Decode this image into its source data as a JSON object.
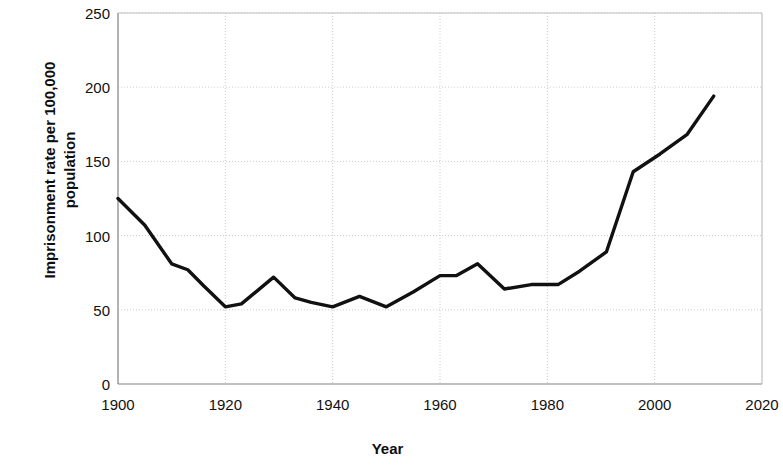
{
  "chart_data": {
    "type": "line",
    "title": "",
    "xlabel": "Year",
    "ylabel": "Imprisonment rate per 100,000\npopulation",
    "xlim": [
      1900,
      2020
    ],
    "ylim": [
      0,
      250
    ],
    "xticks": [
      1900,
      1920,
      1940,
      1960,
      1980,
      2000,
      2020
    ],
    "yticks": [
      0,
      50,
      100,
      150,
      200,
      250
    ],
    "xtick_labels": [
      "1900",
      "1920",
      "1940",
      "1960",
      "1980",
      "2000",
      "2020"
    ],
    "ytick_labels": [
      "0",
      "50",
      "100",
      "150",
      "200",
      "250"
    ],
    "grid": true,
    "legend": null,
    "line_color": "#111111",
    "grid_color": "#cccccc",
    "axis_color": "#808080",
    "series": [
      {
        "name": "Imprisonment rate",
        "x": [
          1900,
          1905,
          1910,
          1913,
          1916,
          1920,
          1923,
          1929,
          1933,
          1936,
          1940,
          1945,
          1950,
          1955,
          1960,
          1963,
          1967,
          1972,
          1977,
          1982,
          1986,
          1991,
          1996,
          2001,
          2006,
          2011
        ],
        "y": [
          125,
          107,
          81,
          77,
          66,
          52,
          54,
          72,
          58,
          55,
          52,
          59,
          52,
          62,
          73,
          73,
          81,
          64,
          67,
          67,
          76,
          89,
          143,
          155,
          168,
          194
        ]
      }
    ]
  }
}
